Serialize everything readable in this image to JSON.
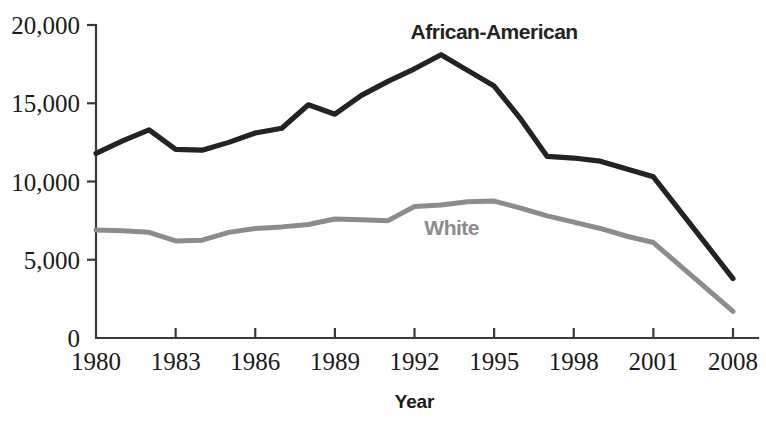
{
  "chart_data": {
    "type": "line",
    "title": "",
    "xlabel": "Year",
    "ylabel": "",
    "grid": false,
    "legend_position": "inline-annotation",
    "xlim": [
      1980,
      2008
    ],
    "ylim": [
      0,
      20000
    ],
    "x_tick_labels": [
      "1980",
      "1983",
      "1986",
      "1989",
      "1992",
      "1995",
      "1998",
      "2001",
      "2008"
    ],
    "x_tick_values": [
      1980,
      1983,
      1986,
      1989,
      1992,
      1995,
      1998,
      2001,
      2008
    ],
    "x_axis_note": "Final interval 2001 to 2008 is compressed to the same pixel width as the three-year intervals",
    "y_tick_labels": [
      "0",
      "5,000",
      "10,000",
      "15,000",
      "20,000"
    ],
    "y_tick_values": [
      0,
      5000,
      10000,
      15000,
      20000
    ],
    "x": [
      1980,
      1981,
      1982,
      1983,
      1984,
      1985,
      1986,
      1987,
      1988,
      1989,
      1990,
      1991,
      1992,
      1993,
      1994,
      1995,
      1996,
      1997,
      1998,
      1999,
      2000,
      2001,
      2008
    ],
    "series": [
      {
        "name": "African-American",
        "color": "#232323",
        "label_x": 1995.0,
        "label_y": 19100,
        "values": [
          11800,
          12600,
          13300,
          12050,
          12000,
          12500,
          13100,
          13400,
          14900,
          14300,
          15500,
          16400,
          17200,
          18100,
          17100,
          16100,
          14000,
          11600,
          11500,
          11300,
          10800,
          10300,
          3800
        ]
      },
      {
        "name": "White",
        "color": "#8c8c8c",
        "label_x": 1993.4,
        "label_y": 6600,
        "values": [
          6900,
          6850,
          6750,
          6200,
          6250,
          6750,
          7000,
          7100,
          7250,
          7600,
          7550,
          7500,
          8400,
          8500,
          8700,
          8750,
          8300,
          7800,
          7400,
          7000,
          6500,
          6100,
          1700
        ]
      }
    ]
  },
  "axes": {
    "x_title": "Year"
  }
}
